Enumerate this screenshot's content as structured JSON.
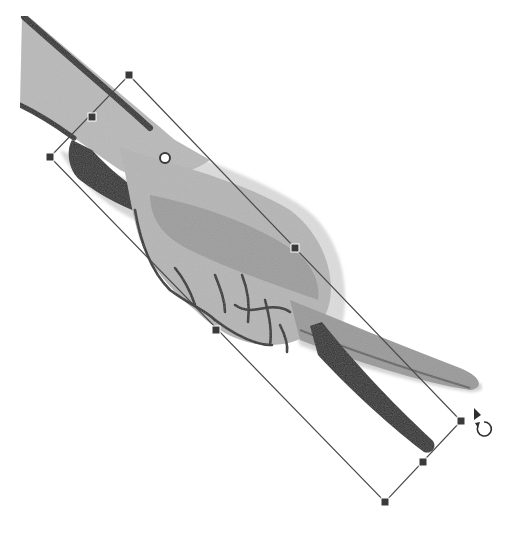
{
  "canvas": {
    "label": "Drawing canvas",
    "background": "#ffffff"
  },
  "artwork": {
    "subject": "hand holding a pen",
    "colors": {
      "skin_light": "#b9b9b9",
      "skin_mid": "#a3a3a3",
      "skin_shadow": "#8e8e8e",
      "outline": "#2e2e2e",
      "pen_dark": "#2f2f2f",
      "pen_light": "#9a9a9a",
      "ghost": "#d4d4d4"
    }
  },
  "transform_box": {
    "label": "Selection transform box",
    "line_color": "#4a4a4a",
    "handle_color": "#3a3a3a",
    "corners": {
      "top": [
        129,
        75
      ],
      "left": [
        50,
        157
      ],
      "bottom": [
        385,
        502
      ],
      "right": [
        461,
        421
      ]
    },
    "midpoints": {
      "top_left_edge": [
        92,
        117
      ],
      "right_edge": [
        295,
        248
      ],
      "left_edge": [
        216,
        330
      ],
      "bottom_edge": [
        423,
        462
      ]
    },
    "pivot": [
      165,
      158
    ]
  },
  "cursor": {
    "type": "rotate",
    "icon": "rotate-cursor-icon",
    "position": [
      480,
      425
    ]
  }
}
